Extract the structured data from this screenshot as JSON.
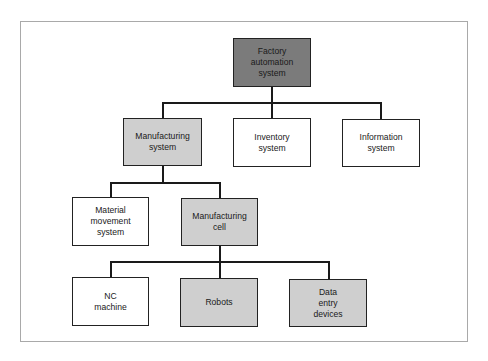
{
  "diagram": {
    "type": "hierarchy",
    "colors": {
      "dark": "#7b7b7b",
      "light": "#cfcfcf",
      "white": "#ffffff",
      "line": "#1a1a1a",
      "frame": "#a9a9a9"
    },
    "root": {
      "label": "Factory\nautomation\nsystem",
      "shade": "dark"
    },
    "level2": [
      {
        "label": "Manufacturing\nsystem",
        "shade": "light"
      },
      {
        "label": "Inventory\nsystem",
        "shade": "white"
      },
      {
        "label": "Information\nsystem",
        "shade": "white"
      }
    ],
    "level3": [
      {
        "label": "Material\nmovement\nsystem",
        "shade": "white"
      },
      {
        "label": "Manufacturing\ncell",
        "shade": "light"
      }
    ],
    "level4": [
      {
        "label": "NC\nmachine",
        "shade": "white"
      },
      {
        "label": "Robots",
        "shade": "light"
      },
      {
        "label": "Data\nentry\ndevices",
        "shade": "light"
      }
    ],
    "edges": [
      [
        "Factory automation system",
        "Manufacturing system"
      ],
      [
        "Factory automation system",
        "Inventory system"
      ],
      [
        "Factory automation system",
        "Information system"
      ],
      [
        "Manufacturing system",
        "Material movement system"
      ],
      [
        "Manufacturing system",
        "Manufacturing cell"
      ],
      [
        "Manufacturing cell",
        "NC machine"
      ],
      [
        "Manufacturing cell",
        "Robots"
      ],
      [
        "Manufacturing cell",
        "Data entry devices"
      ]
    ]
  }
}
